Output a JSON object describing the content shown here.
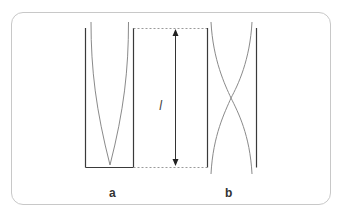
{
  "diagram": {
    "length_symbol": "l",
    "panels": [
      {
        "id": "a",
        "label": "a"
      },
      {
        "id": "b",
        "label": "b"
      }
    ],
    "colors": {
      "wall": "#3a3a3a",
      "curve": "#8a8a8a",
      "dashed": "#9a9a9a",
      "arrow": "#333333",
      "frame": "#c8c8c8"
    }
  }
}
